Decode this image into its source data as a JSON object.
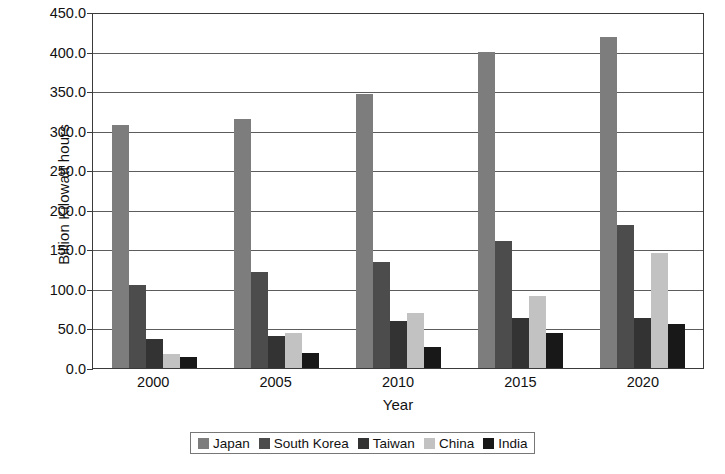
{
  "chart_data": {
    "type": "bar",
    "title": "",
    "xlabel": "Year",
    "ylabel": "Billion Kilowatt hours",
    "categories": [
      "2000",
      "2005",
      "2010",
      "2015",
      "2020"
    ],
    "ylim": [
      0,
      450
    ],
    "ytick_labels": [
      "0.0",
      "50.0",
      "100.0",
      "150.0",
      "200.0",
      "250.0",
      "300.0",
      "350.0",
      "400.0",
      "450.0"
    ],
    "ytick_values": [
      0,
      50,
      100,
      150,
      200,
      250,
      300,
      350,
      400,
      450
    ],
    "grid": true,
    "legend_position": "bottom",
    "series": [
      {
        "name": "Japan",
        "color": "#7d7d7d",
        "values": [
          309,
          317,
          349,
          402,
          421
        ]
      },
      {
        "name": "South Korea",
        "color": "#4c4c4c",
        "values": [
          107,
          123,
          136,
          163,
          183
        ]
      },
      {
        "name": "Taiwan",
        "color": "#333333",
        "values": [
          39,
          42,
          62,
          65,
          65
        ]
      },
      {
        "name": "China",
        "color": "#c2c2c2",
        "values": [
          20,
          46,
          71,
          93,
          147
        ]
      },
      {
        "name": "India",
        "color": "#181818",
        "values": [
          16,
          21,
          29,
          46,
          58
        ]
      }
    ]
  }
}
